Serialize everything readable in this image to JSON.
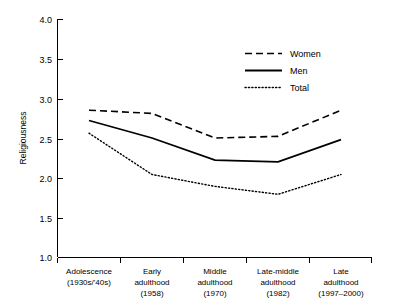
{
  "chart_data": {
    "type": "line",
    "title": "",
    "xlabel": "",
    "ylabel": "Religiousness",
    "ylim": [
      1.0,
      4.0
    ],
    "yticks": [
      "1.0",
      "1.5",
      "2.0",
      "2.5",
      "3.0",
      "3.5",
      "4.0"
    ],
    "ytick_values": [
      1.0,
      1.5,
      2.0,
      2.5,
      3.0,
      3.5,
      4.0
    ],
    "grid": false,
    "legend_position": "upper-right",
    "categories": [
      "Adolescence\n(1930s/'40s)",
      "Early\nadulthood\n(1958)",
      "Middle\nadulthood\n(1970)",
      "Late-middle\nadulthood\n(1982)",
      "Late\nadulthood\n(1997–2000)"
    ],
    "category_lines": [
      [
        "Adolescence",
        "(1930s/'40s)"
      ],
      [
        "Early",
        "adulthood",
        "(1958)"
      ],
      [
        "Middle",
        "adulthood",
        "(1970)"
      ],
      [
        "Late-middle",
        "adulthood",
        "(1982)"
      ],
      [
        "Late",
        "adulthood",
        "(1997–2000)"
      ]
    ],
    "series": [
      {
        "name": "Women",
        "style": "dashed",
        "values": [
          2.85,
          2.81,
          2.5,
          2.52,
          2.85
        ]
      },
      {
        "name": "Men",
        "style": "solid",
        "values": [
          2.72,
          2.5,
          2.22,
          2.2,
          2.48
        ]
      },
      {
        "name": "Total",
        "style": "dotted",
        "values": [
          2.56,
          2.04,
          1.89,
          1.79,
          2.04
        ]
      }
    ]
  },
  "legend": {
    "items": [
      {
        "label": "Women",
        "style": "dashed"
      },
      {
        "label": "Men",
        "style": "solid"
      },
      {
        "label": "Total",
        "style": "dotted"
      }
    ]
  },
  "axes": {
    "y_title": "Religiousness",
    "y_tick_labels": [
      "4.0",
      "3.5",
      "3.0",
      "2.5",
      "2.0",
      "1.5",
      "1.0"
    ]
  },
  "colors": {
    "ink": "#000000",
    "background": "#ffffff"
  }
}
